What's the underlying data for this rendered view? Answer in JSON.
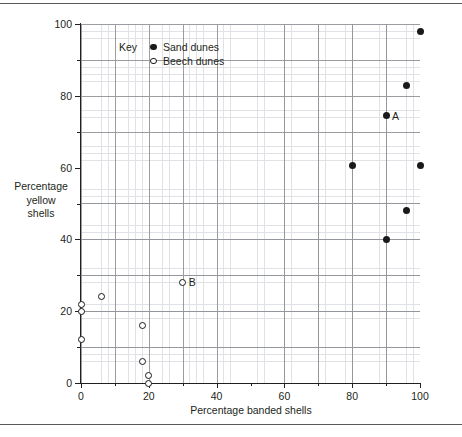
{
  "figure": {
    "background": "#ffffff",
    "frame_rule_color": "#58595b"
  },
  "chart_data": {
    "type": "scatter",
    "title": "",
    "xlabel": "Percentage banded shells",
    "ylabel": "Percentage yellow shells",
    "ylabel_lines": [
      "Percentage",
      "yellow",
      "shells"
    ],
    "xlim": [
      0,
      100
    ],
    "ylim": [
      0,
      100
    ],
    "xticks": [
      0,
      20,
      40,
      60,
      80,
      100
    ],
    "yticks": [
      0,
      20,
      40,
      60,
      80,
      100
    ],
    "xtick_labels": [
      "0",
      "20",
      "40",
      "60",
      "80",
      "100"
    ],
    "ytick_labels": [
      "0",
      "20",
      "40",
      "60",
      "80",
      "100"
    ],
    "grid": true,
    "grid_major_step": 10,
    "grid_minor_step": 2,
    "legend_position": "upper-left-inside",
    "legend_title": "Key",
    "series": [
      {
        "name": "Sand dunes",
        "marker": "filled-circle",
        "color": "#1a1a1a",
        "points": [
          {
            "x": 100,
            "y": 98
          },
          {
            "x": 96,
            "y": 83
          },
          {
            "x": 90,
            "y": 74.5,
            "label": "A"
          },
          {
            "x": 80,
            "y": 60.5
          },
          {
            "x": 100,
            "y": 60.5
          },
          {
            "x": 96,
            "y": 48
          },
          {
            "x": 90,
            "y": 40
          }
        ]
      },
      {
        "name": "Beech dunes",
        "marker": "open-circle",
        "color": "#1a1a1a",
        "points": [
          {
            "x": 30,
            "y": 28,
            "label": "B"
          },
          {
            "x": 6,
            "y": 24
          },
          {
            "x": 0,
            "y": 22
          },
          {
            "x": 0,
            "y": 20
          },
          {
            "x": 18,
            "y": 16
          },
          {
            "x": 0,
            "y": 12
          },
          {
            "x": 18,
            "y": 6
          },
          {
            "x": 20,
            "y": 2
          },
          {
            "x": 20,
            "y": 0
          }
        ]
      }
    ],
    "annotations": [
      {
        "text": "A",
        "x": 90,
        "y": 74.5
      },
      {
        "text": "B",
        "x": 30,
        "y": 28
      }
    ]
  },
  "legend": {
    "key_word": "Key",
    "entries": [
      {
        "label": "Sand dunes",
        "marker": "filled-circle"
      },
      {
        "label": "Beech dunes",
        "marker": "open-circle"
      }
    ]
  }
}
